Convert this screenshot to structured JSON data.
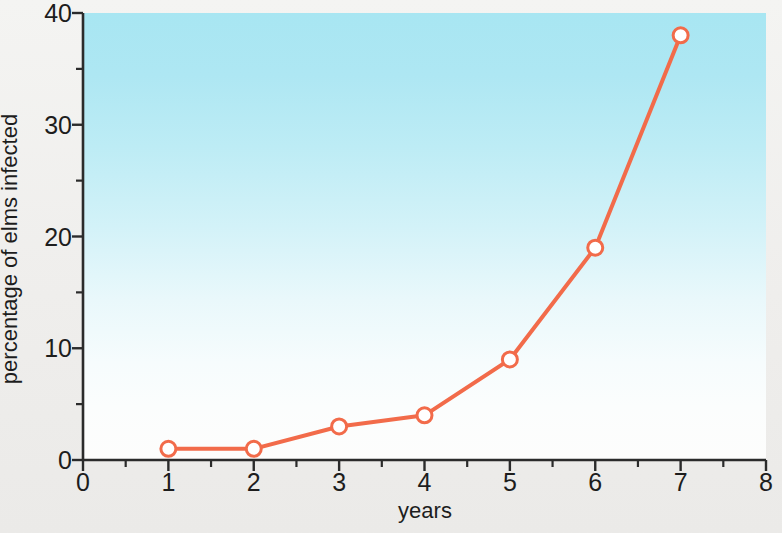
{
  "chart_data": {
    "type": "line",
    "title": "",
    "xlabel": "years",
    "ylabel": "percentage of elms infected",
    "x": [
      1,
      2,
      3,
      4,
      5,
      6,
      7
    ],
    "values": [
      1,
      1,
      3,
      4,
      9,
      19,
      38
    ],
    "series": [
      {
        "name": "percentage of elms infected",
        "x": [
          1,
          2,
          3,
          4,
          5,
          6,
          7
        ],
        "values": [
          1,
          1,
          3,
          4,
          9,
          19,
          38
        ]
      }
    ],
    "xlim": [
      0,
      8
    ],
    "ylim": [
      0,
      40
    ],
    "x_ticks": [
      0,
      1,
      2,
      3,
      4,
      5,
      6,
      7,
      8
    ],
    "x_tick_labels": [
      "0",
      "1",
      "2",
      "3",
      "4",
      "5",
      "6",
      "7",
      "8"
    ],
    "x_minor_ticks": [
      0.5,
      1.5,
      2.5,
      3.5,
      4.5,
      5.5,
      6.5,
      7.5
    ],
    "y_ticks": [
      0,
      10,
      20,
      30,
      40
    ],
    "y_tick_labels": [
      "0",
      "10",
      "20",
      "30",
      "40"
    ],
    "y_minor_ticks": [
      5,
      15,
      25,
      35
    ],
    "grid": false,
    "legend": "none",
    "marker": "open-circle",
    "colors": {
      "line": "#f26b4a",
      "marker_fill": "#ffffff",
      "marker_stroke": "#f26b4a",
      "axis": "#2b2b2b",
      "text": "#1d1d1d",
      "plot_bg_top": "#a8e6f2",
      "plot_bg_bottom": "#fdfdfc",
      "page_bg": "#f1f0ee"
    }
  }
}
